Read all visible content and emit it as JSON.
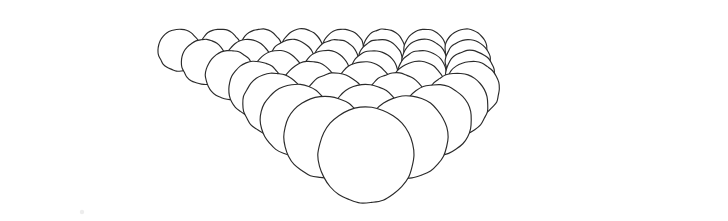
{
  "figure": {
    "title": "Triangular close-packed layer of spheres in perspective",
    "caption": "",
    "medium": "hand-drawn line illustration",
    "background_color": "#ffffff",
    "stroke_color": "#2b2b2b",
    "fill_color": "#ffffff",
    "stroke_width": 1.15,
    "canvas": {
      "width": 728,
      "height": 221
    }
  },
  "geometry": {
    "description": "Equilateral triangular raft of touching spheres viewed from a low front angle; rows recede from the front apex toward the back, each receding row sitting higher on the page and rendered smaller by perspective.",
    "row_count": 8,
    "front_apex": {
      "cx": 366,
      "cy": 155,
      "r": 48
    },
    "spheres_per_row": [
      1,
      2,
      3,
      4,
      5,
      6,
      7,
      8
    ],
    "total_spheres": 36,
    "perspective": {
      "vanishing_y": -86,
      "row_scale_ratio": 0.845,
      "row_rise_px": 17.5,
      "horizontal_spread_ratio": 1.155,
      "row_tilt": 0.0
    },
    "rows": [
      {
        "index": 0,
        "label": "front-row",
        "y": 155,
        "r": 48,
        "spacing": 95,
        "count": 1,
        "centers_x": [
          366
        ]
      },
      {
        "index": 1,
        "label": "row-2",
        "y": 137,
        "r": 41,
        "spacing": 81,
        "count": 2,
        "centers_x": [
          325,
          407
        ]
      },
      {
        "index": 2,
        "label": "row-3",
        "y": 120,
        "r": 35.5,
        "spacing": 70,
        "count": 3,
        "centers_x": [
          296,
          366,
          436
        ]
      },
      {
        "index": 3,
        "label": "row-4",
        "y": 104,
        "r": 31,
        "spacing": 61,
        "count": 4,
        "centers_x": [
          274,
          335,
          396,
          457
        ]
      },
      {
        "index": 4,
        "label": "row-5",
        "y": 89,
        "r": 27.5,
        "spacing": 54,
        "count": 5,
        "centers_x": [
          256,
          310,
          364,
          418,
          472
        ]
      },
      {
        "index": 5,
        "label": "row-6",
        "y": 75,
        "r": 24.5,
        "spacing": 48,
        "count": 6,
        "centers_x": [
          230,
          278,
          326,
          374,
          422,
          470
        ]
      },
      {
        "index": 6,
        "label": "row-7",
        "y": 62,
        "r": 22.5,
        "spacing": 44,
        "count": 7,
        "centers_x": [
          204,
          248,
          292,
          336,
          380,
          424,
          468
        ]
      },
      {
        "index": 7,
        "label": "back-row",
        "y": 50,
        "r": 21,
        "spacing": 41,
        "count": 8,
        "centers_x": [
          179,
          220,
          261,
          302,
          343,
          384,
          425,
          466
        ]
      }
    ],
    "left_edge_spheres": 8,
    "right_edge_spheres": 8,
    "back_edge_spheres": 8
  },
  "artifacts": {
    "speck": {
      "cx": 82,
      "cy": 212,
      "r": 2.2
    }
  }
}
